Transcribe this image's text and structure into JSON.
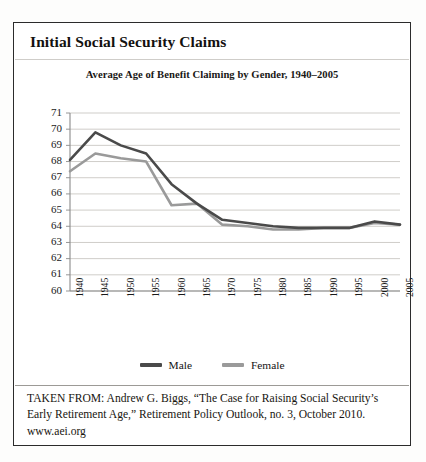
{
  "figure": {
    "title": "Initial Social Security Claims",
    "caption": "TAKEN FROM: Andrew G. Biggs, “The Case for Raising Social Security’s Early Retirement Age,” Retirement Policy Outlook, no. 3, October 2010. www.aei.org"
  },
  "colors": {
    "male_line": "#4a4a4a",
    "female_line": "#9a9a9a",
    "axis": "#8a8a8a",
    "gridline": "#c9c7c3",
    "border": "#2b2b2b",
    "text": "#17150f"
  },
  "chart_data": {
    "type": "line",
    "title": "Average Age of Benefit Claiming by Gender, 1940–2005",
    "xlabel": "",
    "ylabel": "",
    "x": [
      1940,
      1945,
      1950,
      1955,
      1960,
      1965,
      1970,
      1975,
      1980,
      1985,
      1990,
      1995,
      2000,
      2005
    ],
    "categories": [
      "1940",
      "1945",
      "1950",
      "1955",
      "1960",
      "1965",
      "1970",
      "1975",
      "1980",
      "1985",
      "1990",
      "1995",
      "2000",
      "2005"
    ],
    "series": [
      {
        "name": "Male",
        "color": "#4a4a4a",
        "values": [
          68.1,
          69.8,
          69.0,
          68.5,
          66.6,
          65.4,
          64.4,
          64.2,
          64.0,
          63.9,
          63.9,
          63.9,
          64.3,
          64.1
        ]
      },
      {
        "name": "Female",
        "color": "#9a9a9a",
        "values": [
          67.4,
          68.5,
          68.2,
          68.0,
          65.3,
          65.4,
          64.1,
          64.0,
          63.8,
          63.8,
          63.9,
          63.9,
          64.2,
          64.1
        ]
      }
    ],
    "ylim": [
      60,
      71
    ],
    "yticks": [
      60,
      61,
      62,
      63,
      64,
      65,
      66,
      67,
      68,
      69,
      70,
      71
    ],
    "ytick_labels": [
      "60",
      "61",
      "62",
      "63",
      "64",
      "65",
      "66",
      "67",
      "68",
      "69",
      "70",
      "71"
    ],
    "grid": true,
    "grid_axis": "y",
    "legend_position": "bottom",
    "legend": [
      "Male",
      "Female"
    ]
  }
}
